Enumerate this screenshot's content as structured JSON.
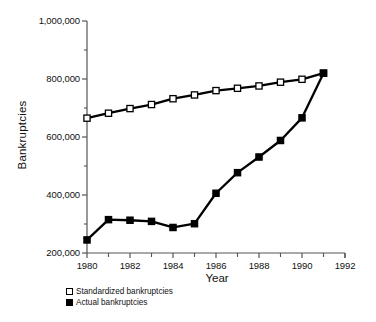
{
  "chart_data": {
    "type": "line",
    "title": "",
    "xlabel": "Year",
    "ylabel": "Bankruptcies",
    "x": [
      1980,
      1981,
      1982,
      1983,
      1984,
      1985,
      1986,
      1987,
      1988,
      1989,
      1990,
      1991
    ],
    "xlim": [
      1980,
      1992
    ],
    "ylim": [
      200000,
      1000000
    ],
    "xticks": [
      1980,
      1982,
      1984,
      1986,
      1988,
      1990,
      1992
    ],
    "xtick_labels": [
      "1980",
      "1982",
      "1984",
      "1986",
      "1988",
      "1990",
      "1992"
    ],
    "xminor_ticks": [
      1981,
      1983,
      1985,
      1987,
      1989,
      1991
    ],
    "yticks": [
      200000,
      400000,
      600000,
      800000,
      1000000
    ],
    "ytick_labels": [
      "200,000",
      "400,000",
      "600,000",
      "800,000",
      "1,000,000"
    ],
    "yminor_ticks": [
      300000,
      500000,
      700000,
      900000
    ],
    "grid": false,
    "legend_position": "below-left",
    "series": [
      {
        "name": "Standardized bankruptcies",
        "marker": "open-square",
        "color": "#000000",
        "marker_fill": "#ffffff",
        "values": [
          665000,
          682000,
          698000,
          712000,
          732000,
          745000,
          760000,
          768000,
          776000,
          789000,
          799000,
          820000
        ]
      },
      {
        "name": "Actual bankruptcies",
        "marker": "filled-square",
        "color": "#000000",
        "marker_fill": "#000000",
        "values": [
          245000,
          315000,
          313000,
          309000,
          288000,
          301000,
          406000,
          477000,
          531000,
          588000,
          666000,
          820000
        ]
      }
    ]
  },
  "axes": {
    "y_label": "Bankruptcies",
    "x_label": "Year"
  },
  "legend": {
    "items": [
      {
        "label": "Standardized bankruptcies",
        "marker": "open-square"
      },
      {
        "label": "Actual bankruptcies",
        "marker": "filled-square"
      }
    ]
  }
}
